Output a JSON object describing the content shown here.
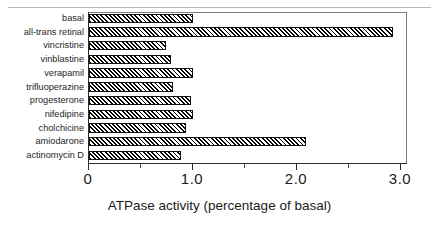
{
  "figure": {
    "top_rule": "horizontal-rule"
  },
  "axis": {
    "title": "ATPase activity (percentage of basal)",
    "tick_labels": [
      "0",
      "1.0",
      "2.0",
      "3.0"
    ],
    "tick_values": [
      0,
      1.0,
      2.0,
      3.0
    ],
    "minor_tick_values": [
      0.5,
      1.5,
      2.5
    ],
    "min": 0,
    "max": 3.0
  },
  "chart_data": {
    "type": "bar",
    "orientation": "horizontal",
    "title": "",
    "xlabel": "ATPase activity (percentage of basal)",
    "ylabel": "",
    "xlim": [
      0,
      3.0
    ],
    "grid": false,
    "legend": false,
    "bar_fill": "diagonal-hatch",
    "bar_edge_color": "#111111",
    "categories": [
      "basal",
      "all-trans retinal",
      "vincristine",
      "vinblastine",
      "verapamil",
      "trifluoperazine",
      "progesterone",
      "nifedipine",
      "cholchicine",
      "amiodarone",
      "actinomycin D"
    ],
    "values": [
      1.0,
      2.92,
      0.74,
      0.79,
      1.0,
      0.81,
      0.98,
      1.0,
      0.93,
      2.09,
      0.88
    ]
  }
}
